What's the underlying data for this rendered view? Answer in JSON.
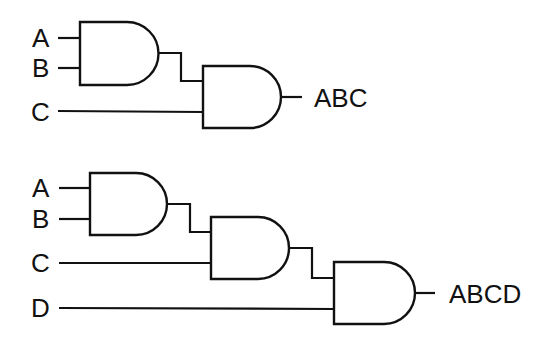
{
  "diagram": {
    "type": "logic-circuit",
    "circuits": [
      {
        "name": "three-input-and",
        "inputs": [
          "A",
          "B",
          "C"
        ],
        "gates": [
          "AND",
          "AND"
        ],
        "output": "ABC"
      },
      {
        "name": "four-input-and",
        "inputs": [
          "A",
          "B",
          "C",
          "D"
        ],
        "gates": [
          "AND",
          "AND",
          "AND"
        ],
        "output": "ABCD"
      }
    ],
    "colors": {
      "line": "#111111",
      "background": "#ffffff"
    }
  },
  "labels": {
    "c1": {
      "a": "A",
      "b": "B",
      "c": "C",
      "out": "ABC"
    },
    "c2": {
      "a": "A",
      "b": "B",
      "c": "C",
      "d": "D",
      "out": "ABCD"
    }
  }
}
